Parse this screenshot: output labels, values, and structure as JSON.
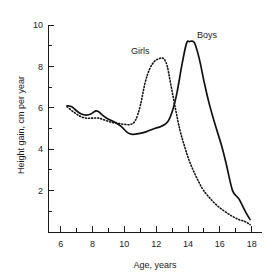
{
  "chart_data": {
    "type": "line",
    "title": "",
    "xlabel": "Age, years",
    "ylabel": "Height gain, cm per year",
    "xlim": [
      5.2,
      18.4
    ],
    "ylim": [
      0,
      10
    ],
    "grid": false,
    "legend_position": "inline-annotations",
    "x_ticks_major": [
      6,
      8,
      10,
      12,
      14,
      16,
      18
    ],
    "x_ticks_minor": [
      7,
      9,
      11,
      13,
      15,
      17
    ],
    "y_ticks_major": [
      2,
      4,
      6,
      8,
      10
    ],
    "y_ticks_minor": [
      1,
      3,
      5,
      7,
      9
    ],
    "x_tick_labels": [
      "6",
      "8",
      "10",
      "12",
      "14",
      "16",
      "18"
    ],
    "y_tick_labels": [
      "2",
      "4",
      "6",
      "8",
      "10"
    ],
    "series": [
      {
        "name": "Boys",
        "style": "solid",
        "label_text": "Boys",
        "x": [
          6.4,
          6.7,
          7.0,
          7.3,
          7.6,
          7.9,
          8.2,
          8.4,
          8.7,
          9.0,
          9.4,
          9.8,
          10.2,
          10.5,
          10.9,
          11.4,
          11.9,
          12.3,
          12.7,
          13.0,
          13.3,
          13.6,
          13.9,
          14.1,
          14.4,
          14.7,
          15.0,
          15.3,
          15.7,
          16.1,
          16.4,
          16.8,
          17.2,
          17.6,
          17.9
        ],
        "y": [
          6.1,
          6.05,
          5.85,
          5.7,
          5.65,
          5.7,
          5.85,
          5.8,
          5.6,
          5.45,
          5.3,
          5.1,
          4.8,
          4.72,
          4.75,
          4.85,
          5.0,
          5.1,
          5.3,
          5.8,
          6.7,
          8.0,
          9.1,
          9.2,
          9.15,
          8.4,
          7.3,
          6.3,
          5.2,
          4.2,
          3.3,
          2.0,
          1.6,
          1.0,
          0.6
        ]
      },
      {
        "name": "Girls",
        "style": "dotted",
        "label_text": "Girls",
        "x": [
          6.4,
          6.8,
          7.2,
          7.6,
          8.0,
          8.4,
          8.8,
          9.2,
          9.6,
          10.0,
          10.4,
          10.7,
          11.0,
          11.3,
          11.6,
          11.9,
          12.1,
          12.3,
          12.5,
          12.7,
          12.9,
          13.2,
          13.5,
          13.8,
          14.1,
          14.5,
          14.9,
          15.3,
          15.8,
          16.3,
          16.8,
          17.2,
          17.6,
          17.9
        ],
        "y": [
          6.05,
          5.8,
          5.6,
          5.5,
          5.5,
          5.5,
          5.4,
          5.3,
          5.25,
          5.2,
          5.2,
          5.4,
          6.1,
          7.2,
          7.9,
          8.25,
          8.35,
          8.4,
          8.35,
          8.0,
          7.2,
          6.0,
          4.9,
          4.1,
          3.4,
          2.7,
          2.1,
          1.7,
          1.3,
          1.0,
          0.75,
          0.6,
          0.5,
          0.35
        ]
      }
    ],
    "annotations": [
      {
        "text": "Girls",
        "x": 11.0,
        "y": 8.6
      },
      {
        "text": "Boys",
        "x": 15.2,
        "y": 9.35
      }
    ]
  }
}
